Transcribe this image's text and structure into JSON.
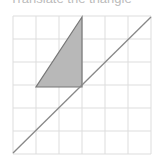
{
  "caption": "Translate the triangle",
  "colors": {
    "grid": "#dddddd",
    "triangle_fill": "#b8b8b8",
    "triangle_stroke": "#777777",
    "line": "#888888"
  },
  "grid": {
    "x_lines": [
      13,
      36,
      59,
      82,
      105,
      128,
      151
    ],
    "y_lines": [
      16,
      39,
      62,
      85,
      108,
      131,
      154
    ]
  },
  "triangle": {
    "points": "82,17 36,87 82,87"
  },
  "line": {
    "x1": 151,
    "y1": 17,
    "x2": 13,
    "y2": 153
  }
}
